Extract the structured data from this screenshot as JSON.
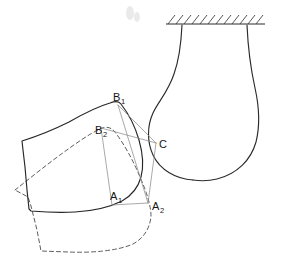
{
  "figure": {
    "background_color": "#ffffff",
    "ink_color": "#262626",
    "construction_color": "#8c8c8c",
    "dashed_color": "#4a4a4a",
    "labels": [
      {
        "id": "B1",
        "base": "B",
        "sub": "1",
        "x": 113,
        "y": 101,
        "describes": "contact point B subscript one on solid-line body, upper position"
      },
      {
        "id": "B2",
        "base": "B",
        "sub": "2",
        "x": 95,
        "y": 134,
        "describes": "contact point B subscript two on dashed-line body, displaced position"
      },
      {
        "id": "C",
        "base": "C",
        "sub": "",
        "x": 157,
        "y": 148,
        "describes": "point C on the fixed support surface"
      },
      {
        "id": "A1",
        "base": "A",
        "sub": "1",
        "x": 110,
        "y": 200,
        "describes": "contact point A subscript one on solid-line body"
      },
      {
        "id": "A2",
        "base": "A",
        "sub": "2",
        "x": 152,
        "y": 210,
        "describes": "contact point A subscript two on dashed-line body"
      }
    ],
    "elements": {
      "ceiling": {
        "name": "fixed ground / hatched ceiling",
        "line_x1": 166,
        "line_y1": 24,
        "line_x2": 265,
        "line_y2": 24,
        "hatch_count": 12,
        "hatch_length": 9
      },
      "support_body": {
        "name": "bulb-shaped fixed support hanging from ceiling",
        "path": "M 182 25 C 181 48 178 62 172 80 C 164 100 155 108 152 120 C 148 134 150 148 158 160 C 167 173 183 180 198 180 C 220 180 240 172 250 156 C 260 140 261 120 257 100 C 252 78 248 52 247 25"
      },
      "solid_body": {
        "name": "rigid body outline, position 1 (solid line)",
        "path": "M 22 141 C 40 134 58 126 72 119 C 86 112 98 106 113 103 C 119 102 122 102 124 104 C 131 112 137 124 141 138 C 145 152 146 164 143 176 C 140 188 133 196 124 201 C 112 207 95 211 76 212 C 58 213 42 212 30 211 L 29 210 C 28 195 26 170 24 155 Z"
      },
      "dashed_body": {
        "name": "rigid body outline, position 2 (dashed line, displaced)",
        "path": "M 15 190 C 30 178 48 164 64 152 C 80 140 92 131 104 127 C 110 125 114 126 117 130 C 126 141 135 157 142 174 C 149 190 153 205 153 216 C 152 228 146 238 136 245 C 120 252 95 253 70 252 L 41 251 C 38 234 32 210 28 198 Z"
      },
      "construction_lines": [
        {
          "name": "B1 to C",
          "x1": 118,
          "y1": 105,
          "x2": 156,
          "y2": 143
        },
        {
          "name": "B2 to C",
          "x1": 100,
          "y1": 128,
          "x2": 156,
          "y2": 143
        },
        {
          "name": "B1 to A2",
          "x1": 118,
          "y1": 105,
          "x2": 148,
          "y2": 203
        },
        {
          "name": "C to A2",
          "x1": 156,
          "y1": 143,
          "x2": 148,
          "y2": 203
        },
        {
          "name": "A1 to A2",
          "x1": 113,
          "y1": 205,
          "x2": 148,
          "y2": 203
        },
        {
          "name": "B2 to A1",
          "x1": 100,
          "y1": 128,
          "x2": 113,
          "y2": 205
        }
      ]
    }
  }
}
